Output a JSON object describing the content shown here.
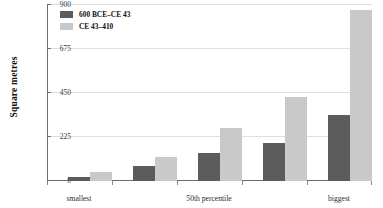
{
  "chart_data": {
    "type": "bar",
    "title": "",
    "xlabel": "",
    "ylabel": "Square metres",
    "ylim": [
      0,
      900
    ],
    "yticks": [
      0,
      225,
      450,
      675,
      900
    ],
    "grid": true,
    "legend_position": "top-left",
    "categories": [
      "smallest",
      "",
      "50th percentile",
      "",
      "biggest"
    ],
    "tick_labels": [
      "smallest",
      "50th percentile",
      "biggest"
    ],
    "series": [
      {
        "name": "600 BCE–CE 43",
        "color": "#5c5c5c",
        "values": [
          20,
          75,
          140,
          195,
          335
        ]
      },
      {
        "name": "CE 43–410",
        "color": "#c9c9c9",
        "values": [
          45,
          120,
          270,
          425,
          870
        ]
      }
    ]
  },
  "axis": {
    "y_title": "Square metres",
    "y_tick_0": "0",
    "y_tick_1": "225",
    "y_tick_2": "450",
    "y_tick_3": "675",
    "y_tick_4": "900",
    "x_tick_0": "smallest",
    "x_tick_1": "50th percentile",
    "x_tick_2": "biggest"
  },
  "legend": {
    "item_0_label": "600 BCE–CE 43",
    "item_1_label": "CE 43–410"
  },
  "colors": {
    "series_dark": "#5c5c5c",
    "series_light": "#c9c9c9",
    "axis": "#6e6e6e",
    "grid": "#dedede"
  }
}
